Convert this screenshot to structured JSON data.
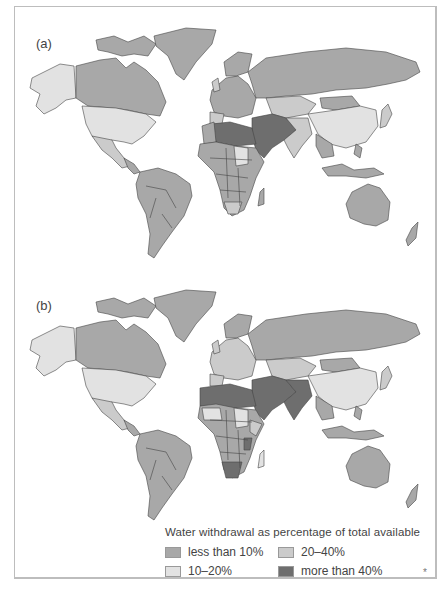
{
  "panels": [
    {
      "label": "(a)"
    },
    {
      "label": "(b)"
    }
  ],
  "legend": {
    "title": "Water withdrawal as percentage of total available",
    "items": [
      {
        "label": "less than 10%",
        "color": "#a8a8a8"
      },
      {
        "label": "20–40%",
        "color": "#cbcbcb"
      },
      {
        "label": "10–20%",
        "color": "#e2e2e2"
      },
      {
        "label": "more than 40%",
        "color": "#6e6e6e"
      }
    ]
  },
  "footnote": "*",
  "colors": {
    "lt10": "#a8a8a8",
    "b10_20": "#e2e2e2",
    "b20_40": "#cbcbcb",
    "gt40": "#6e6e6e",
    "border": "#444444",
    "frame": "#bdbdbd"
  }
}
